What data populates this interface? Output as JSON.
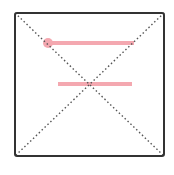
{
  "diagram": {
    "type": "placeholder-wireframe",
    "frame": {
      "x": 15,
      "y": 13,
      "width": 149,
      "height": 143,
      "stroke": "#333333",
      "stroke_width": 2,
      "corner_radius": 2
    },
    "diagonals": {
      "stroke": "#555555",
      "dasharray": "1.5 2.5",
      "stroke_width": 1.4
    },
    "highlight_color": "#f4a8b0",
    "marker": {
      "cx": 48,
      "cy": 43,
      "r": 5
    },
    "bars": [
      {
        "x1": 48,
        "y1": 43,
        "x2": 134,
        "y2": 43,
        "width": 4
      },
      {
        "x1": 58,
        "y1": 84,
        "x2": 132,
        "y2": 84,
        "width": 4
      }
    ]
  }
}
